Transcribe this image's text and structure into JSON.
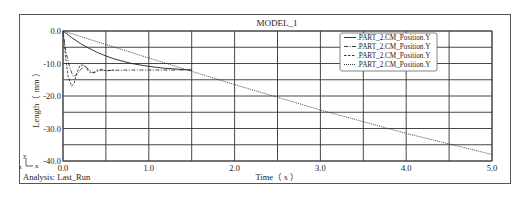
{
  "chart_data": {
    "type": "line",
    "title": "MODEL_1",
    "xlabel": "Time（ s ）",
    "ylabel": "Length（ mm ）",
    "xlim": [
      0.0,
      5.0
    ],
    "ylim": [
      -40.0,
      0.0
    ],
    "x_ticks": [
      "0.0",
      "1.0",
      "2.0",
      "3.0",
      "4.0",
      "5.0"
    ],
    "y_ticks": [
      "0.0",
      "-10.0",
      "-20.0",
      "-30.0",
      "-40.0"
    ],
    "grid": true,
    "legend_position": "upper-right",
    "footer": "Analysis: Last_Run",
    "axis_triad": {
      "y": "y",
      "x": "x",
      "z": "z"
    },
    "series": [
      {
        "name": ".PART_2.CM_Position.Y",
        "style": "solid",
        "x": [
          0.0,
          0.1,
          0.2,
          0.3,
          0.4,
          0.5,
          0.6,
          0.8,
          1.0,
          1.2,
          1.5
        ],
        "y": [
          0.0,
          -2.0,
          -3.8,
          -5.3,
          -6.6,
          -7.7,
          -8.6,
          -10.0,
          -10.9,
          -11.5,
          -12.0
        ]
      },
      {
        "name": ".PART_2.CM_Position.Y",
        "style": "dash-dot",
        "x": [
          0.0,
          0.03,
          0.08,
          0.12,
          0.16,
          0.2,
          0.25,
          0.3,
          0.35,
          0.4,
          0.45,
          0.5,
          0.6,
          0.8,
          1.0,
          1.5
        ],
        "y": [
          0.0,
          -6.0,
          -11.5,
          -14.0,
          -13.5,
          -12.0,
          -10.8,
          -11.8,
          -12.8,
          -12.5,
          -12.0,
          -12.2,
          -12.1,
          -12.0,
          -12.0,
          -12.0
        ]
      },
      {
        "name": ".PART_2.CM_Position.Y",
        "style": "dashed",
        "x": [
          0.0,
          0.03,
          0.06,
          0.1,
          0.13,
          0.16,
          0.2,
          0.25,
          0.3,
          0.35,
          0.4,
          0.45,
          0.5,
          0.6
        ],
        "y": [
          0.0,
          -8.0,
          -14.0,
          -17.0,
          -16.0,
          -13.0,
          -10.5,
          -10.5,
          -12.5,
          -13.0,
          -12.0,
          -11.8,
          -12.2,
          -12.0
        ]
      },
      {
        "name": ".PART_2.CM_Position.Y",
        "style": "dotted",
        "x": [
          0.0,
          1.0,
          2.0,
          3.0,
          4.0,
          5.0
        ],
        "y": [
          0.0,
          -8.3,
          -16.5,
          -24.3,
          -31.5,
          -38.0
        ]
      }
    ]
  },
  "window": {
    "title": "MODEL_1",
    "analysis_label": "Analysis: Last_Run"
  }
}
